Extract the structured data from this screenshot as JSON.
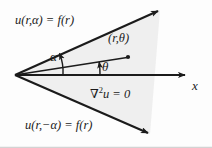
{
  "figure": {
    "background_color": "#fdfdfd",
    "stroke_color": "#1b1b1b",
    "wedge_fill_color": "#ebebeb",
    "labels": {
      "upper_boundary_condition": "u(r,α) = f(r)",
      "lower_boundary_condition": "u(r,−α) = f(r)",
      "point_polar": "(r,θ)",
      "laplace_nabla": "∇",
      "laplace_exponent": "2",
      "laplace_rest": "u = 0",
      "angle_alpha": "α",
      "angle_theta": "θ",
      "axis_x": "x"
    },
    "geometry": {
      "vertex": [
        15,
        75
      ],
      "upper_ray_tip": [
        162,
        9
      ],
      "lower_ray_tip": [
        152,
        137
      ],
      "x_axis_tip": [
        190,
        75
      ],
      "point_dot": [
        128,
        57
      ],
      "alpha_degrees": 24,
      "theta_degrees": 10
    }
  }
}
